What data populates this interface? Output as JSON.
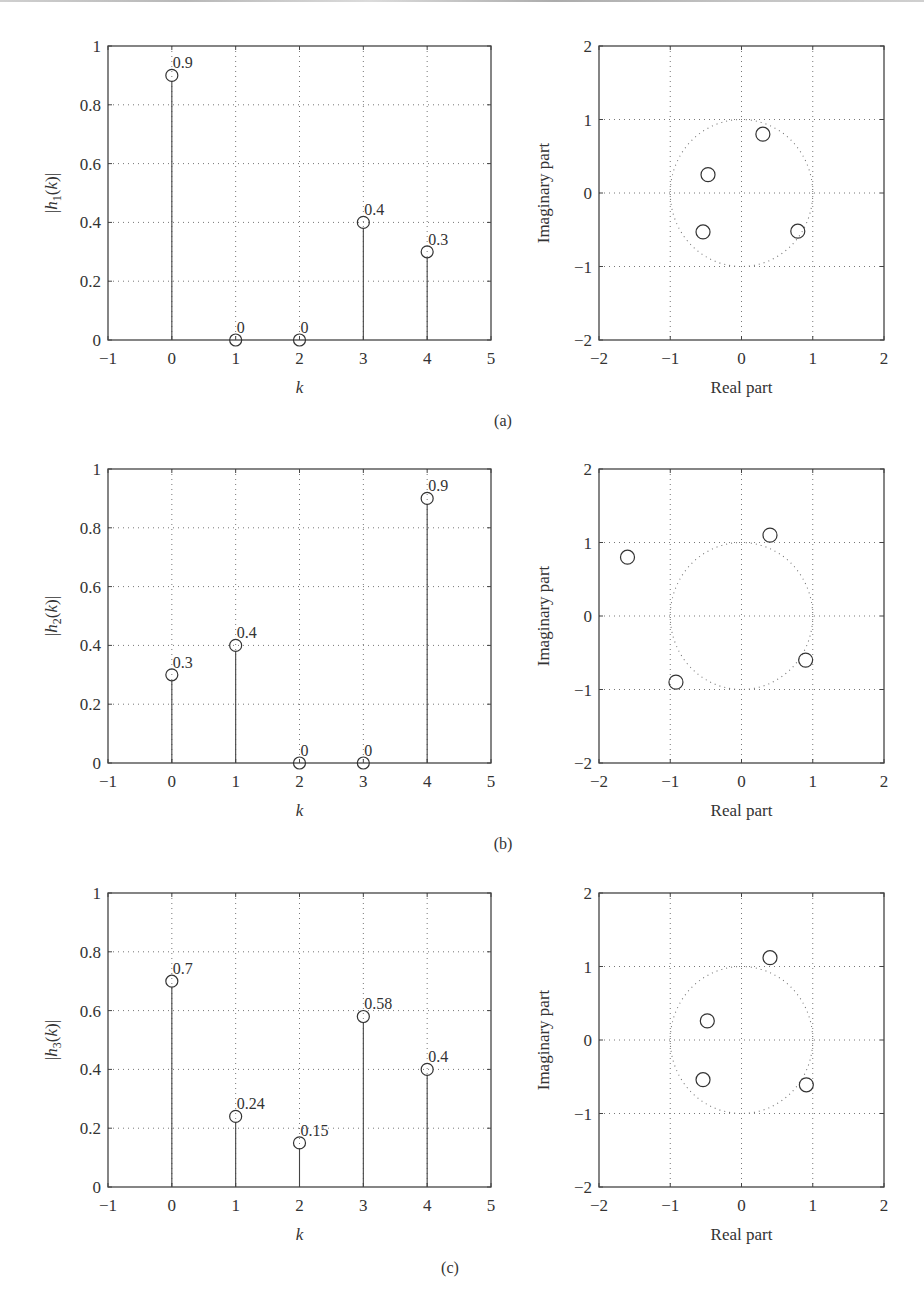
{
  "figure": {
    "captions": [
      "(a)",
      "(b)",
      "(c)"
    ]
  },
  "chart_data": [
    {
      "type": "scatter",
      "subtype": "stem",
      "panel": "(a)",
      "title": "",
      "xlabel": "k",
      "ylabel": "|h1(k)|",
      "ylabel_parts": {
        "pre": "|",
        "var": "h",
        "sub": "1",
        "arg": "k",
        "post": "|"
      },
      "xlim": [
        -1,
        5
      ],
      "ylim": [
        0,
        1
      ],
      "xticks": [
        "-1",
        "0",
        "1",
        "2",
        "3",
        "4",
        "5"
      ],
      "yticks": [
        "0",
        "0.2",
        "0.4",
        "0.6",
        "0.8",
        "1"
      ],
      "grid": true,
      "x": [
        0,
        1,
        2,
        3,
        4
      ],
      "values": [
        0.9,
        0,
        0,
        0.4,
        0.3
      ],
      "labels": [
        "0.9",
        "0",
        "0",
        "0.4",
        "0.3"
      ]
    },
    {
      "type": "scatter",
      "subtype": "pole-zero",
      "panel": "(a)",
      "title": "",
      "xlabel": "Real part",
      "ylabel": "Imaginary part",
      "xlim": [
        -2,
        2
      ],
      "ylim": [
        -2,
        2
      ],
      "xticks": [
        "-2",
        "-1",
        "0",
        "1",
        "2"
      ],
      "yticks": [
        "-2",
        "-1",
        "0",
        "1",
        "2"
      ],
      "grid": true,
      "unit_circle": true,
      "zeros": [
        {
          "re": 0.3,
          "im": 0.8
        },
        {
          "re": -0.47,
          "im": 0.25
        },
        {
          "re": -0.54,
          "im": -0.53
        },
        {
          "re": 0.79,
          "im": -0.52
        }
      ]
    },
    {
      "type": "scatter",
      "subtype": "stem",
      "panel": "(b)",
      "title": "",
      "xlabel": "k",
      "ylabel": "|h2(k)|",
      "ylabel_parts": {
        "pre": "|",
        "var": "h",
        "sub": "2",
        "arg": "k",
        "post": "|"
      },
      "xlim": [
        -1,
        5
      ],
      "ylim": [
        0,
        1
      ],
      "xticks": [
        "-1",
        "0",
        "1",
        "2",
        "3",
        "4",
        "5"
      ],
      "yticks": [
        "0",
        "0.2",
        "0.4",
        "0.6",
        "0.8",
        "1"
      ],
      "grid": true,
      "x": [
        0,
        1,
        2,
        3,
        4
      ],
      "values": [
        0.3,
        0.4,
        0,
        0,
        0.9
      ],
      "labels": [
        "0.3",
        "0.4",
        "0",
        "0",
        "0.9"
      ]
    },
    {
      "type": "scatter",
      "subtype": "pole-zero",
      "panel": "(b)",
      "title": "",
      "xlabel": "Real part",
      "ylabel": "Imaginary part",
      "xlim": [
        -2,
        2
      ],
      "ylim": [
        -2,
        2
      ],
      "xticks": [
        "-2",
        "-1",
        "0",
        "1",
        "2"
      ],
      "yticks": [
        "-2",
        "-1",
        "0",
        "1",
        "2"
      ],
      "grid": true,
      "unit_circle": true,
      "zeros": [
        {
          "re": -1.6,
          "im": 0.8
        },
        {
          "re": 0.4,
          "im": 1.1
        },
        {
          "re": -0.92,
          "im": -0.9
        },
        {
          "re": 0.9,
          "im": -0.6
        }
      ]
    },
    {
      "type": "scatter",
      "subtype": "stem",
      "panel": "(c)",
      "title": "",
      "xlabel": "k",
      "ylabel": "|h3(k)|",
      "ylabel_parts": {
        "pre": "|",
        "var": "h",
        "sub": "3",
        "arg": "k",
        "post": "|"
      },
      "xlim": [
        -1,
        5
      ],
      "ylim": [
        0,
        1
      ],
      "xticks": [
        "-1",
        "0",
        "1",
        "2",
        "3",
        "4",
        "5"
      ],
      "yticks": [
        "0",
        "0.2",
        "0.4",
        "0.6",
        "0.8",
        "1"
      ],
      "grid": true,
      "x": [
        0,
        1,
        2,
        3,
        4
      ],
      "values": [
        0.7,
        0.24,
        0.15,
        0.58,
        0.4
      ],
      "labels": [
        "0.7",
        "0.24",
        "0.15",
        "0.58",
        "0.4"
      ]
    },
    {
      "type": "scatter",
      "subtype": "pole-zero",
      "panel": "(c)",
      "title": "",
      "xlabel": "Real part",
      "ylabel": "Imaginary part",
      "xlim": [
        -2,
        2
      ],
      "ylim": [
        -2,
        2
      ],
      "xticks": [
        "-2",
        "-1",
        "0",
        "1",
        "2"
      ],
      "yticks": [
        "-2",
        "-1",
        "0",
        "1",
        "2"
      ],
      "grid": true,
      "unit_circle": true,
      "zeros": [
        {
          "re": 0.4,
          "im": 1.12
        },
        {
          "re": -0.48,
          "im": 0.26
        },
        {
          "re": -0.54,
          "im": -0.54
        },
        {
          "re": 0.91,
          "im": -0.61
        }
      ]
    }
  ]
}
